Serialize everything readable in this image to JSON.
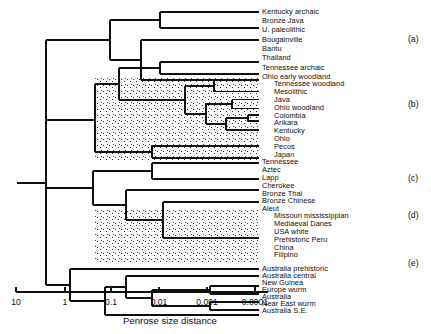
{
  "figure": {
    "kind": "dendrogram",
    "axis_title": "Penrose size distance",
    "axis_ticks": [
      {
        "label": "10",
        "x": 16
      },
      {
        "label": "1",
        "x": 65
      },
      {
        "label": "0.1",
        "x": 111
      },
      {
        "label": "0.01",
        "x": 159
      },
      {
        "label": "0.001",
        "x": 207
      },
      {
        "label": "0.0001",
        "x": 255
      }
    ],
    "axis_line": {
      "x1": 16,
      "x2": 268,
      "y": 292
    },
    "ink_color": "#101010",
    "background_color": "#ffffff",
    "stipple_color": "#3a3a3a"
  },
  "groups": [
    {
      "id": "a",
      "label": "(a)",
      "x": 408,
      "y": 39
    },
    {
      "id": "b",
      "label": "(b)",
      "x": 408,
      "y": 104
    },
    {
      "id": "c",
      "label": "(c)",
      "x": 408,
      "y": 178
    },
    {
      "id": "d",
      "label": "(d)",
      "x": 408,
      "y": 215
    },
    {
      "id": "e",
      "label": "(e)",
      "x": 408,
      "y": 263
    }
  ],
  "leaves": [
    {
      "label": "Kentucky archaic",
      "y": 12,
      "tip_x": 259,
      "indent": 0,
      "group": "a"
    },
    {
      "label": "Bronze Java",
      "y": 21.3,
      "tip_x": 259,
      "indent": 0,
      "group": "a"
    },
    {
      "label": "U. paleolithic",
      "y": 30.6,
      "tip_x": 259,
      "indent": 0,
      "group": "a"
    },
    {
      "label": "Bougainville",
      "y": 39.9,
      "tip_x": 259,
      "indent": 0,
      "group": "a"
    },
    {
      "label": "Bantu",
      "y": 49.2,
      "tip_x": 259,
      "indent": 0,
      "group": "a"
    },
    {
      "label": "Thailand",
      "y": 58.5,
      "tip_x": 259,
      "indent": 0,
      "group": "a"
    },
    {
      "label": "Tennessee archaic",
      "y": 67.8,
      "tip_x": 259,
      "indent": 0,
      "group": "a"
    },
    {
      "label": "Ohio early woodland",
      "y": 77.1,
      "tip_x": 259,
      "indent": 0,
      "group": "a"
    },
    {
      "label": "Tennessee woodland",
      "y": 84.5,
      "tip_x": 259,
      "indent": 12,
      "group": "b"
    },
    {
      "label": "Mesolithic",
      "y": 92.3,
      "tip_x": 259,
      "indent": 12,
      "group": "b"
    },
    {
      "label": "Java",
      "y": 100.1,
      "tip_x": 259,
      "indent": 12,
      "group": "b"
    },
    {
      "label": "Ohio woodland",
      "y": 107.9,
      "tip_x": 259,
      "indent": 12,
      "group": "b"
    },
    {
      "label": "Colombia",
      "y": 115.7,
      "tip_x": 259,
      "indent": 12,
      "group": "b"
    },
    {
      "label": "Arikara",
      "y": 123.5,
      "tip_x": 259,
      "indent": 12,
      "group": "b"
    },
    {
      "label": "Kentucky",
      "y": 131.3,
      "tip_x": 259,
      "indent": 12,
      "group": "b"
    },
    {
      "label": "Ohio",
      "y": 139.1,
      "tip_x": 259,
      "indent": 12,
      "group": "b"
    },
    {
      "label": "Pecos",
      "y": 146.9,
      "tip_x": 259,
      "indent": 12,
      "group": "b"
    },
    {
      "label": "Japan",
      "y": 154.7,
      "tip_x": 259,
      "indent": 12,
      "group": "b"
    },
    {
      "label": "Tennessee",
      "y": 162.5,
      "tip_x": 259,
      "indent": 0,
      "group": "c"
    },
    {
      "label": "Aztec",
      "y": 170.3,
      "tip_x": 259,
      "indent": 0,
      "group": "c"
    },
    {
      "label": "Lapp",
      "y": 178.1,
      "tip_x": 259,
      "indent": 0,
      "group": "c"
    },
    {
      "label": "Cherokee",
      "y": 185.9,
      "tip_x": 259,
      "indent": 0,
      "group": "c"
    },
    {
      "label": "Bronze Thai",
      "y": 193.7,
      "tip_x": 259,
      "indent": 0,
      "group": "c"
    },
    {
      "label": "Bronze Chinese",
      "y": 201.5,
      "tip_x": 259,
      "indent": 0,
      "group": "c"
    },
    {
      "label": "Aleut",
      "y": 209.3,
      "tip_x": 259,
      "indent": 0,
      "group": "c"
    },
    {
      "label": "Missouri mississippian",
      "y": 216.6,
      "tip_x": 259,
      "indent": 12,
      "group": "d"
    },
    {
      "label": "Mediaeval Danes",
      "y": 224.4,
      "tip_x": 259,
      "indent": 12,
      "group": "d"
    },
    {
      "label": "USA white",
      "y": 232.2,
      "tip_x": 259,
      "indent": 12,
      "group": "d"
    },
    {
      "label": "Prehistoric Peru",
      "y": 240.0,
      "tip_x": 259,
      "indent": 12,
      "group": "d"
    },
    {
      "label": "China",
      "y": 247.8,
      "tip_x": 259,
      "indent": 12,
      "group": "d"
    },
    {
      "label": "Filipino",
      "y": 255.6,
      "tip_x": 259,
      "indent": 12,
      "group": "d"
    },
    {
      "label": "Australia prehistoric",
      "y": 269.0,
      "tip_x": 259,
      "indent": 0,
      "group": "e"
    },
    {
      "label": "Australia central",
      "y": 276.0,
      "tip_x": 259,
      "indent": 0,
      "group": "e"
    },
    {
      "label": "New Guinea",
      "y": 283.0,
      "tip_x": 259,
      "indent": 0,
      "group": "e"
    },
    {
      "label": "Europe wurm",
      "y": 290.0,
      "tip_x": 259,
      "indent": 0,
      "group": "e"
    },
    {
      "label": "Australia",
      "y": 297.0,
      "tip_x": 259,
      "indent": 0,
      "group": "e"
    },
    {
      "label": "Near East wurm",
      "y": 304.0,
      "tip_x": 259,
      "indent": 0,
      "group": "e"
    },
    {
      "label": "Australia S.E.",
      "y": 311.0,
      "tip_x": 259,
      "indent": 0,
      "group": "e"
    }
  ],
  "tree_segments": {
    "comment": "Each item is an axis-aligned polyline of the dendrogram drawn in pixel coords: h = horizontal {x1,x2,y}; v = vertical {x,y1,y2}",
    "horizontal": [
      {
        "x1": 17,
        "x2": 46,
        "y": 183.0
      },
      {
        "x1": 46,
        "x2": 110,
        "y": 40.0
      },
      {
        "x1": 110,
        "x2": 160,
        "y": 20.0
      },
      {
        "x1": 160,
        "x2": 259,
        "y": 12.0
      },
      {
        "x1": 160,
        "x2": 259,
        "y": 28.0
      },
      {
        "x1": 110,
        "x2": 141,
        "y": 60.0
      },
      {
        "x1": 141,
        "x2": 259,
        "y": 40.0
      },
      {
        "x1": 141,
        "x2": 259,
        "y": 80.0
      },
      {
        "x1": 46,
        "x2": 95,
        "y": 120.0
      },
      {
        "x1": 95,
        "x2": 119,
        "y": 84.0
      },
      {
        "x1": 119,
        "x2": 160,
        "y": 68.0
      },
      {
        "x1": 160,
        "x2": 259,
        "y": 62.0
      },
      {
        "x1": 160,
        "x2": 259,
        "y": 74.0
      },
      {
        "x1": 119,
        "x2": 185,
        "y": 100.0
      },
      {
        "x1": 185,
        "x2": 214,
        "y": 86.0
      },
      {
        "x1": 214,
        "x2": 259,
        "y": 80.5
      },
      {
        "x1": 214,
        "x2": 259,
        "y": 91.5
      },
      {
        "x1": 185,
        "x2": 206,
        "y": 114.0
      },
      {
        "x1": 206,
        "x2": 232,
        "y": 104.0
      },
      {
        "x1": 232,
        "x2": 259,
        "y": 99.5
      },
      {
        "x1": 232,
        "x2": 259,
        "y": 108.5
      },
      {
        "x1": 206,
        "x2": 226,
        "y": 124.0
      },
      {
        "x1": 226,
        "x2": 248,
        "y": 118.0
      },
      {
        "x1": 248,
        "x2": 259,
        "y": 115.0
      },
      {
        "x1": 248,
        "x2": 259,
        "y": 121.0
      },
      {
        "x1": 226,
        "x2": 259,
        "y": 130.0
      },
      {
        "x1": 95,
        "x2": 152,
        "y": 152.0
      },
      {
        "x1": 152,
        "x2": 259,
        "y": 146.0
      },
      {
        "x1": 152,
        "x2": 259,
        "y": 158.0
      },
      {
        "x1": 46,
        "x2": 93,
        "y": 188.0
      },
      {
        "x1": 93,
        "x2": 152,
        "y": 171.0
      },
      {
        "x1": 152,
        "x2": 259,
        "y": 163.0
      },
      {
        "x1": 152,
        "x2": 259,
        "y": 179.0
      },
      {
        "x1": 93,
        "x2": 126,
        "y": 205.0
      },
      {
        "x1": 126,
        "x2": 259,
        "y": 190.0
      },
      {
        "x1": 126,
        "x2": 163,
        "y": 220.0
      },
      {
        "x1": 163,
        "x2": 259,
        "y": 202.0
      },
      {
        "x1": 163,
        "x2": 259,
        "y": 238.0
      },
      {
        "x1": 46,
        "x2": 70,
        "y": 285.0
      },
      {
        "x1": 70,
        "x2": 259,
        "y": 269.0
      },
      {
        "x1": 70,
        "x2": 105,
        "y": 301.0
      },
      {
        "x1": 105,
        "x2": 126,
        "y": 287.0
      },
      {
        "x1": 126,
        "x2": 259,
        "y": 276.0
      },
      {
        "x1": 126,
        "x2": 152,
        "y": 298.0
      },
      {
        "x1": 152,
        "x2": 210,
        "y": 290.0
      },
      {
        "x1": 210,
        "x2": 259,
        "y": 286.0
      },
      {
        "x1": 210,
        "x2": 259,
        "y": 294.0
      },
      {
        "x1": 152,
        "x2": 210,
        "y": 306.0
      },
      {
        "x1": 210,
        "x2": 259,
        "y": 302.0
      },
      {
        "x1": 210,
        "x2": 259,
        "y": 310.0
      },
      {
        "x1": 105,
        "x2": 259,
        "y": 315.0
      }
    ],
    "vertical": [
      {
        "x": 46,
        "y1": 40.0,
        "y2": 285.0
      },
      {
        "x": 110,
        "y1": 20.0,
        "y2": 60.0
      },
      {
        "x": 160,
        "y1": 12.0,
        "y2": 28.0
      },
      {
        "x": 141,
        "y1": 40.0,
        "y2": 80.0
      },
      {
        "x": 95,
        "y1": 84.0,
        "y2": 152.0
      },
      {
        "x": 119,
        "y1": 68.0,
        "y2": 100.0
      },
      {
        "x": 160,
        "y1": 62.0,
        "y2": 74.0
      },
      {
        "x": 185,
        "y1": 86.0,
        "y2": 114.0
      },
      {
        "x": 214,
        "y1": 80.5,
        "y2": 91.5
      },
      {
        "x": 206,
        "y1": 104.0,
        "y2": 124.0
      },
      {
        "x": 232,
        "y1": 99.5,
        "y2": 108.5
      },
      {
        "x": 226,
        "y1": 118.0,
        "y2": 130.0
      },
      {
        "x": 248,
        "y1": 115.0,
        "y2": 121.0
      },
      {
        "x": 152,
        "y1": 146.0,
        "y2": 158.0
      },
      {
        "x": 93,
        "y1": 171.0,
        "y2": 205.0
      },
      {
        "x": 152,
        "y1": 163.0,
        "y2": 179.0
      },
      {
        "x": 126,
        "y1": 190.0,
        "y2": 220.0
      },
      {
        "x": 163,
        "y1": 202.0,
        "y2": 238.0
      },
      {
        "x": 70,
        "y1": 269.0,
        "y2": 301.0
      },
      {
        "x": 105,
        "y1": 287.0,
        "y2": 315.0
      },
      {
        "x": 126,
        "y1": 276.0,
        "y2": 298.0
      },
      {
        "x": 152,
        "y1": 290.0,
        "y2": 306.0
      },
      {
        "x": 210,
        "y1": 286.0,
        "y2": 294.0
      },
      {
        "x": 210,
        "y1": 302.0,
        "y2": 310.0
      }
    ]
  },
  "shaded_regions": [
    {
      "id": "b-outer",
      "x": 95,
      "y": 76,
      "w": 164,
      "h": 84
    },
    {
      "id": "b-inner1",
      "x": 119,
      "y": 76,
      "w": 140,
      "h": 26
    },
    {
      "id": "d-outer",
      "x": 95,
      "y": 210,
      "w": 164,
      "h": 52
    },
    {
      "id": "d-inner1",
      "x": 126,
      "y": 210,
      "w": 133,
      "h": 36
    }
  ]
}
